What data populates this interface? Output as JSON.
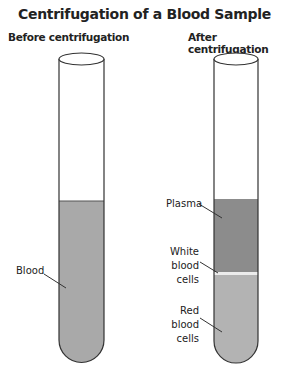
{
  "title": "Centrifugation of a Blood Sample",
  "tubes": {
    "before": {
      "heading": "Before centrifugation",
      "labels": {
        "blood": "Blood"
      }
    },
    "after": {
      "heading": "After centrifugation",
      "labels": {
        "plasma": "Plasma",
        "white_line1": "White",
        "white_line2": "blood",
        "white_line3": "cells",
        "red_line1": "Red",
        "red_line2": "blood",
        "red_line3": "cells"
      }
    }
  },
  "colors": {
    "blood": "#a9a9a9",
    "plasma": "#8c8c8c",
    "white_cells": "#ececec",
    "red_cells": "#b3b3b3",
    "outline": "#333333"
  }
}
